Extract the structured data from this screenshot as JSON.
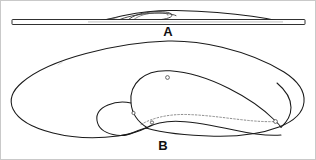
{
  "figure": {
    "background_color": "#ffffff",
    "line_color": "#1a1a1a",
    "width": 316,
    "height": 160,
    "views": [
      {
        "id": "A",
        "label": "A",
        "name": "profile-view",
        "description": "Side elevation of footwear resting on a flat horizontal base bar",
        "label_x": 168,
        "label_y": 36
      },
      {
        "id": "B",
        "label": "B",
        "name": "plan-view",
        "description": "Top plan view of footwear outline showing quarter panel, tongue and eyelets",
        "label_x": 163,
        "label_y": 150
      }
    ],
    "base_bar": {
      "name": "ground-base-bar",
      "x_start": 12,
      "x_end": 305,
      "y_top": 19.5,
      "y_bottom": 24.5
    },
    "eyelets": [
      {
        "name": "eyelet-upper",
        "cx": 167.5,
        "cy": 77.5,
        "r": 1.9
      },
      {
        "name": "eyelet-lower-left",
        "cx": 133.5,
        "cy": 113.0,
        "r": 1.6
      },
      {
        "name": "eyelet-mid",
        "cx": 152.0,
        "cy": 122.5,
        "r": 1.6
      },
      {
        "name": "eyelet-heel",
        "cx": 275.5,
        "cy": 121.5,
        "r": 1.9
      }
    ],
    "annotations": {
      "seam_style": "dashed",
      "view_a_caption": "A",
      "view_b_caption": "B"
    }
  }
}
